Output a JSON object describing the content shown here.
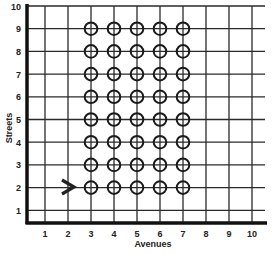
{
  "diagram": {
    "type": "grid-map",
    "x_axis": {
      "title": "Avenues",
      "ticks": [
        "1",
        "2",
        "3",
        "4",
        "5",
        "6",
        "7",
        "8",
        "9",
        "10"
      ]
    },
    "y_axis": {
      "title": "Streets",
      "ticks": [
        "1",
        "2",
        "3",
        "4",
        "5",
        "6",
        "7",
        "8",
        "9",
        "10"
      ]
    },
    "markers": {
      "shape": "circle-crosshair",
      "avenues": [
        3,
        4,
        5,
        6,
        7
      ],
      "streets": [
        2,
        3,
        4,
        5,
        6,
        7,
        8,
        9
      ]
    },
    "arrow": {
      "direction": "right",
      "avenue_position": 2.5,
      "street": 2
    },
    "colors": {
      "line": "#2a2a2a",
      "axis": "#111111",
      "background": "#ffffff"
    }
  }
}
